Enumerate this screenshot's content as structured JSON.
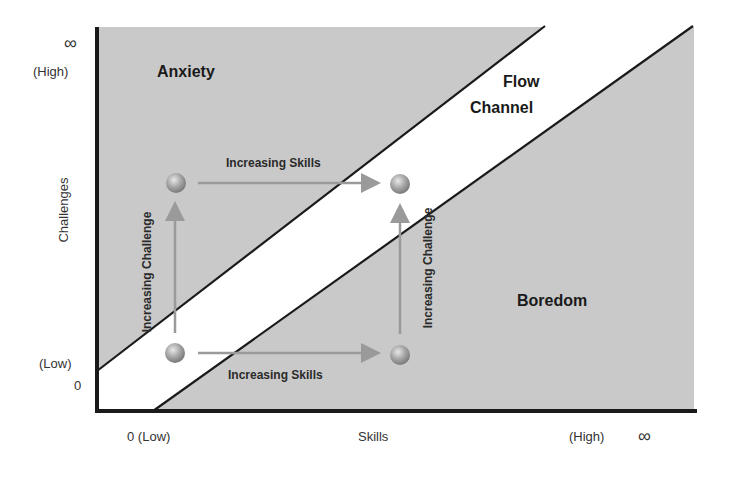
{
  "diagram": {
    "colors": {
      "region_fill": "#c9c9c9",
      "flow_channel_fill": "#ffffff",
      "boundary_line": "#1a1a1a",
      "axis_line": "#1a1a1a",
      "arrow": "#9a9a9a",
      "node": "#a8a8a8"
    },
    "y_axis": {
      "label": "Challenges",
      "top_symbol": "∞",
      "top_label": "(High)",
      "bottom_label": "(Low)",
      "zero_label": "0"
    },
    "x_axis": {
      "label": "Skills",
      "left_label": "0 (Low)",
      "right_label": "(High)",
      "right_symbol": "∞"
    },
    "regions": {
      "anxiety": "Anxiety",
      "flow_line1": "Flow",
      "flow_line2": "Channel",
      "boredom": "Boredom"
    },
    "arrows": {
      "top_horizontal": "Increasing Skills",
      "bottom_horizontal": "Increasing Skills",
      "left_vertical": "Increasing Challenge",
      "right_vertical": "Increasing Challenge"
    },
    "nodes": [
      {
        "name": "low-skill-high-challenge",
        "x": 176,
        "y": 183
      },
      {
        "name": "high-skill-high-challenge",
        "x": 400,
        "y": 184
      },
      {
        "name": "low-skill-low-challenge",
        "x": 175,
        "y": 353
      },
      {
        "name": "high-skill-low-challenge",
        "x": 400,
        "y": 355
      }
    ]
  }
}
